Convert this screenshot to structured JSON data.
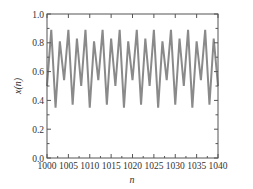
{
  "chart_data": {
    "type": "line",
    "title": "",
    "xlabel": "n",
    "ylabel": "x(n)",
    "xlim": [
      1000,
      1040
    ],
    "ylim": [
      0.0,
      1.0
    ],
    "grid": false,
    "legend": null,
    "x_ticks": [
      1000,
      1005,
      1010,
      1015,
      1020,
      1025,
      1030,
      1035,
      1040
    ],
    "x_tick_labels": [
      "1000",
      "1005",
      "1010",
      "1015",
      "1020",
      "1025",
      "1030",
      "1035",
      "1040"
    ],
    "y_ticks": [
      0.0,
      0.2,
      0.4,
      0.6,
      0.8,
      1.0
    ],
    "y_tick_labels": [
      "0.0",
      "0.2",
      "0.4",
      "0.6",
      "0.8",
      "1.0"
    ],
    "line_color": "#8a8a8a",
    "series": [
      {
        "name": "x(n)",
        "x": [
          1000,
          1001,
          1002,
          1003,
          1004,
          1005,
          1006,
          1007,
          1008,
          1009,
          1010,
          1011,
          1012,
          1013,
          1014,
          1015,
          1016,
          1017,
          1018,
          1019,
          1020,
          1021,
          1022,
          1023,
          1024,
          1025,
          1026,
          1027,
          1028,
          1029,
          1030,
          1031,
          1032,
          1033,
          1034,
          1035,
          1036,
          1037,
          1038,
          1039,
          1040
        ],
        "values": [
          0.5,
          0.89,
          0.35,
          0.81,
          0.54,
          0.89,
          0.37,
          0.83,
          0.5,
          0.89,
          0.35,
          0.81,
          0.54,
          0.89,
          0.37,
          0.83,
          0.5,
          0.89,
          0.35,
          0.81,
          0.54,
          0.89,
          0.37,
          0.83,
          0.5,
          0.89,
          0.35,
          0.81,
          0.54,
          0.89,
          0.37,
          0.83,
          0.5,
          0.89,
          0.35,
          0.81,
          0.54,
          0.89,
          0.37,
          0.83,
          0.5
        ]
      }
    ]
  }
}
